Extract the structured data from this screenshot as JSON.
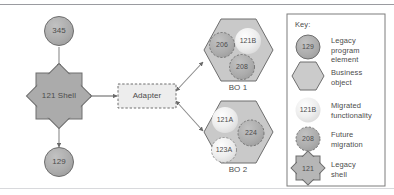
{
  "diagram": {
    "nodes": {
      "legacy_in": {
        "label": "345",
        "shape": "circle",
        "style": "legacy-program-element"
      },
      "shell": {
        "label": "121 Shell",
        "shape": "8-point-star",
        "style": "legacy-shell"
      },
      "legacy_out": {
        "label": "129",
        "shape": "circle",
        "style": "legacy-program-element"
      },
      "adapter": {
        "label": "Adapter",
        "shape": "dashed-rectangle",
        "style": "adapter"
      },
      "bo1": {
        "label": "BO 1",
        "shape": "hexagon",
        "style": "business-object"
      },
      "bo2": {
        "label": "BO 2",
        "shape": "hexagon",
        "style": "business-object"
      }
    },
    "bo1_members": [
      {
        "label": "206",
        "style": "future-migration"
      },
      {
        "label": "121B",
        "style": "migrated-functionality"
      },
      {
        "label": "208",
        "style": "future-migration"
      }
    ],
    "bo2_members": [
      {
        "label": "121A",
        "style": "migrated-functionality"
      },
      {
        "label": "224",
        "style": "future-migration"
      },
      {
        "label": "123A",
        "style": "migrated-functionality-dashed"
      }
    ]
  },
  "key": {
    "heading": "Key:",
    "items": [
      {
        "sample": "129",
        "shape": "circle",
        "text": "Legacy\nprogram\nelement"
      },
      {
        "sample": "",
        "shape": "hexagon",
        "text": "Business\nobject"
      },
      {
        "sample": "121B",
        "shape": "circle-light",
        "text": "Migrated\nfunctionality"
      },
      {
        "sample": "208",
        "shape": "circle-dashed",
        "text": "Future\nmigration"
      },
      {
        "sample": "121",
        "shape": "star",
        "text": "Legacy\nshell"
      }
    ]
  },
  "colors": {
    "solid_gray_fill": "#a8a8a8",
    "hexagon_fill": "#c9c9c9",
    "light_fill": "#e8e8e8",
    "stroke": "#6e6e6e",
    "line": "#8b8b8b",
    "text": "#4c4c4c"
  }
}
